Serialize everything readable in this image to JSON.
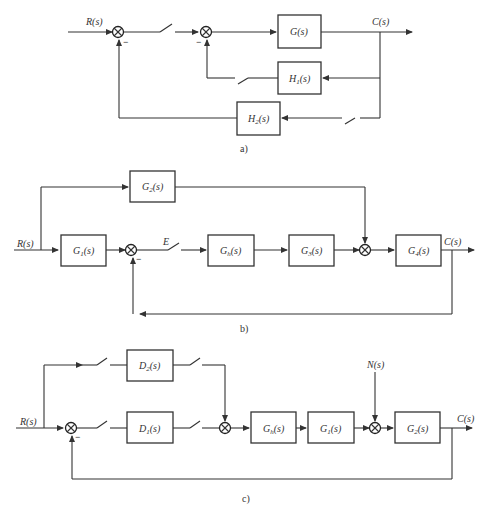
{
  "diagrams": [
    {
      "id": "a",
      "caption": "a)",
      "input": "R(s)",
      "output": "C(s)",
      "blocks": [
        "G(s)",
        "H1(s)",
        "H2(s)"
      ],
      "summing_junctions": 2,
      "switches": 3,
      "signs": [
        "−",
        "−"
      ]
    },
    {
      "id": "b",
      "caption": "b)",
      "input": "R(s)",
      "output": "C(s)",
      "error_label": "E",
      "blocks": [
        "G2(s)",
        "G1(s)",
        "Gh(s)",
        "G3(s)",
        "G4(s)"
      ],
      "summing_junctions": 2,
      "switches": 1,
      "signs": [
        "−"
      ]
    },
    {
      "id": "c",
      "caption": "c)",
      "input": "R(s)",
      "output": "C(s)",
      "disturbance": "N(s)",
      "blocks": [
        "D2(s)",
        "D1(s)",
        "Gh(s)",
        "G1(s)",
        "G2(s)"
      ],
      "summing_junctions": 3,
      "switches": 4,
      "signs": [
        "−"
      ]
    }
  ]
}
